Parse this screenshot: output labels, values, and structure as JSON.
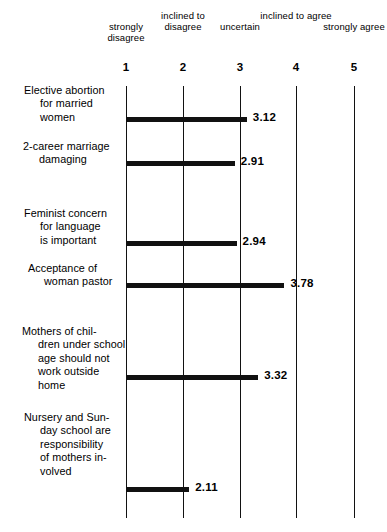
{
  "chart_data": {
    "type": "bar",
    "orientation": "horizontal",
    "title": "",
    "xlabel": "",
    "ylabel": "",
    "xlim": [
      1,
      5
    ],
    "grid": true,
    "legend": null,
    "scale": {
      "ticks": [
        1,
        2,
        3,
        4,
        5
      ],
      "tick_labels": [
        "1",
        "2",
        "3",
        "4",
        "5"
      ],
      "anchor_labels": [
        "strongly\ndisagree",
        "inclined\nto\ndisagree",
        "uncertain",
        "inclined\nto\nagree",
        "strongly\nagree"
      ]
    },
    "categories": [
      "Elective abortion\nfor married\nwomen",
      "2-career marriage\ndamaging",
      "Feminist concern\nfor language\nis important",
      "Acceptance of\nwoman pastor",
      "Mothers of chil-\ndren under school\nage should not\nwork outside\nhome",
      "Nursery and Sun-\nday school are\nresponsibility\nof mothers in-\nvolved"
    ],
    "values": [
      3.12,
      2.91,
      2.94,
      3.78,
      3.32,
      2.11
    ],
    "value_labels": [
      "3.12",
      "2.91",
      "2.94",
      "3.78",
      "3.32",
      "2.11"
    ]
  },
  "colors": {
    "bar": "#111111",
    "gridline": "#121212",
    "text": "#000000",
    "background": "#ffffff"
  }
}
